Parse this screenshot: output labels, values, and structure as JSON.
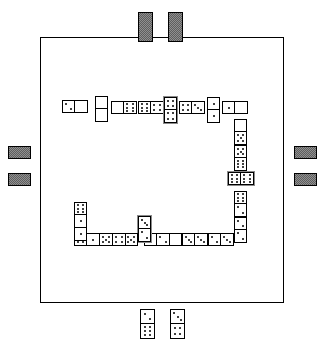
{
  "app": {
    "title": "Dominoes",
    "board_label": "Domino table",
    "layout_shape": "U-shaped chain"
  },
  "colors": {
    "table_border": "#000000",
    "table_fill": "#ffffff",
    "tile_fill": "#ffffff",
    "tile_border": "#000000",
    "pip": "#000000",
    "tile_back": "#8f8f8f",
    "tile_back_pattern": "#5e5e5e",
    "highlight_outline": "#8a8a8a"
  },
  "board": {
    "name": "table-surface",
    "x": 40,
    "y": 37,
    "width": 244,
    "height": 266
  },
  "chain": {
    "label": "played-dominoes-chain",
    "count": 27,
    "tiles": [
      {
        "name": "domino-top-1",
        "values": [
          2,
          0
        ],
        "orient": "h",
        "x": 62,
        "y": 100,
        "w": 26,
        "h": 13,
        "shaded": false
      },
      {
        "name": "domino-top-2",
        "values": [
          0,
          0
        ],
        "orient": "v",
        "x": 95,
        "y": 96,
        "w": 13,
        "h": 26,
        "shaded": false
      },
      {
        "name": "domino-top-3",
        "values": [
          0,
          6
        ],
        "orient": "h",
        "x": 111,
        "y": 101,
        "w": 26,
        "h": 13,
        "shaded": false
      },
      {
        "name": "domino-top-4",
        "values": [
          6,
          4
        ],
        "orient": "h",
        "x": 138,
        "y": 101,
        "w": 26,
        "h": 13,
        "shaded": false
      },
      {
        "name": "domino-top-5",
        "values": [
          4,
          4
        ],
        "orient": "v",
        "x": 164,
        "y": 97,
        "w": 13,
        "h": 26,
        "shaded": true
      },
      {
        "name": "domino-top-6",
        "values": [
          4,
          3
        ],
        "orient": "h",
        "x": 179,
        "y": 101,
        "w": 26,
        "h": 13,
        "shaded": false
      },
      {
        "name": "domino-top-7",
        "values": [
          1,
          1
        ],
        "orient": "v",
        "x": 207,
        "y": 97,
        "w": 13,
        "h": 26,
        "shaded": false
      },
      {
        "name": "domino-top-8",
        "values": [
          1,
          0
        ],
        "orient": "h",
        "x": 222,
        "y": 101,
        "w": 26,
        "h": 13,
        "shaded": false
      },
      {
        "name": "domino-right-1",
        "values": [
          0,
          5
        ],
        "orient": "v",
        "x": 234,
        "y": 119,
        "w": 13,
        "h": 26,
        "shaded": false
      },
      {
        "name": "domino-right-2",
        "values": [
          5,
          6
        ],
        "orient": "v",
        "x": 234,
        "y": 145,
        "w": 13,
        "h": 26,
        "shaded": false
      },
      {
        "name": "domino-right-3",
        "values": [
          6,
          6
        ],
        "orient": "h",
        "x": 228,
        "y": 172,
        "w": 26,
        "h": 13,
        "shaded": true
      },
      {
        "name": "domino-right-4",
        "values": [
          6,
          2
        ],
        "orient": "v",
        "x": 234,
        "y": 191,
        "w": 13,
        "h": 26,
        "shaded": false
      },
      {
        "name": "domino-right-5",
        "values": [
          2,
          2
        ],
        "orient": "v",
        "x": 234,
        "y": 217,
        "w": 13,
        "h": 26,
        "shaded": false
      },
      {
        "name": "domino-bot-1",
        "values": [
          2,
          3
        ],
        "orient": "h",
        "x": 208,
        "y": 233,
        "w": 26,
        "h": 13,
        "shaded": false
      },
      {
        "name": "domino-bot-2",
        "values": [
          3,
          3
        ],
        "orient": "h",
        "x": 182,
        "y": 233,
        "w": 26,
        "h": 13,
        "shaded": false
      },
      {
        "name": "domino-bot-3",
        "values": [
          3,
          0
        ],
        "orient": "h",
        "x": 156,
        "y": 233,
        "w": 26,
        "h": 13,
        "shaded": false
      },
      {
        "name": "domino-bot-4",
        "values": [
          0,
          2
        ],
        "orient": "h",
        "x": 144,
        "y": 233,
        "w": 26,
        "h": 13,
        "shaded": false
      },
      {
        "name": "domino-bot-5",
        "values": [
          3,
          2
        ],
        "orient": "v",
        "x": 138,
        "y": 216,
        "w": 13,
        "h": 26,
        "shaded": true
      },
      {
        "name": "domino-bot-6",
        "values": [
          2,
          5
        ],
        "orient": "h",
        "x": 112,
        "y": 233,
        "w": 26,
        "h": 13,
        "shaded": false
      },
      {
        "name": "domino-bot-7",
        "values": [
          5,
          4
        ],
        "orient": "h",
        "x": 100,
        "y": 233,
        "w": 26,
        "h": 13,
        "shaded": false
      },
      {
        "name": "domino-bot-8",
        "values": [
          4,
          5
        ],
        "orient": "h",
        "x": 87,
        "y": 233,
        "w": 26,
        "h": 13,
        "shaded": false
      },
      {
        "name": "domino-bot-9",
        "values": [
          5,
          1
        ],
        "orient": "h",
        "x": 74,
        "y": 233,
        "w": 26,
        "h": 13,
        "shaded": false
      },
      {
        "name": "domino-left-1",
        "values": [
          1,
          1
        ],
        "orient": "v",
        "x": 74,
        "y": 215,
        "w": 13,
        "h": 26,
        "shaded": false
      },
      {
        "name": "domino-left-2",
        "values": [
          6,
          1
        ],
        "orient": "v",
        "x": 74,
        "y": 202,
        "w": 13,
        "h": 26,
        "shaded": false
      }
    ]
  },
  "hands": {
    "player_bottom": {
      "name": "player-hand-bottom",
      "face_up": true,
      "tiles": [
        {
          "name": "hand-tile-1",
          "values": [
            2,
            6
          ],
          "orient": "v",
          "x": 140,
          "y": 309,
          "w": 15,
          "h": 30
        },
        {
          "name": "hand-tile-2",
          "values": [
            3,
            4
          ],
          "orient": "v",
          "x": 170,
          "y": 309,
          "w": 15,
          "h": 30
        }
      ]
    },
    "opponent_top": {
      "name": "opponent-hand-top",
      "face_up": false,
      "count": 2,
      "tiles": [
        {
          "name": "tile-back-top-1",
          "x": 138,
          "y": 12,
          "w": 15,
          "h": 30
        },
        {
          "name": "tile-back-top-2",
          "x": 168,
          "y": 12,
          "w": 15,
          "h": 30
        }
      ]
    },
    "opponent_left": {
      "name": "opponent-hand-left",
      "face_up": false,
      "count": 2,
      "tiles": [
        {
          "name": "tile-back-left-1",
          "x": 8,
          "y": 146,
          "w": 23,
          "h": 13
        },
        {
          "name": "tile-back-left-2",
          "x": 8,
          "y": 173,
          "w": 23,
          "h": 13
        }
      ]
    },
    "opponent_right": {
      "name": "opponent-hand-right",
      "face_up": false,
      "count": 2,
      "tiles": [
        {
          "name": "tile-back-right-1",
          "x": 294,
          "y": 146,
          "w": 23,
          "h": 13
        },
        {
          "name": "tile-back-right-2",
          "x": 294,
          "y": 173,
          "w": 23,
          "h": 13
        }
      ]
    }
  }
}
